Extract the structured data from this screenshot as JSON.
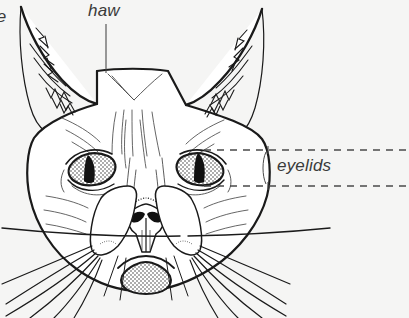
{
  "figure": {
    "background_color": "#f5f5f4",
    "ink_color": "#1a1a1a",
    "label_color": "#3a3a3a"
  },
  "labels": {
    "haw": "haw",
    "eyelids": "eyelids",
    "partial_left": "re"
  },
  "leaders": {
    "haw_line": "vertical",
    "eyelids_upper": "dashed",
    "eyelids_lower": "dashed"
  },
  "parts": {
    "left_ear": "left-ear",
    "right_ear": "right-ear",
    "left_eye": "left-eye",
    "right_eye": "right-eye",
    "nose": "nose",
    "muzzle": "muzzle",
    "chin": "chin",
    "whiskers": "whiskers",
    "forehead_marking": "forehead-v-marking"
  }
}
